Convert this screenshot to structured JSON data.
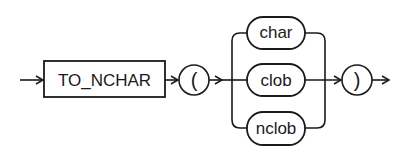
{
  "diagram": {
    "type": "railroad-syntax-diagram",
    "keyword": "TO_NCHAR",
    "open_paren": "(",
    "close_paren": ")",
    "choices": [
      "char",
      "clob",
      "nclob"
    ],
    "colors": {
      "line": "#1a1a1a",
      "background": "#ffffff"
    }
  }
}
